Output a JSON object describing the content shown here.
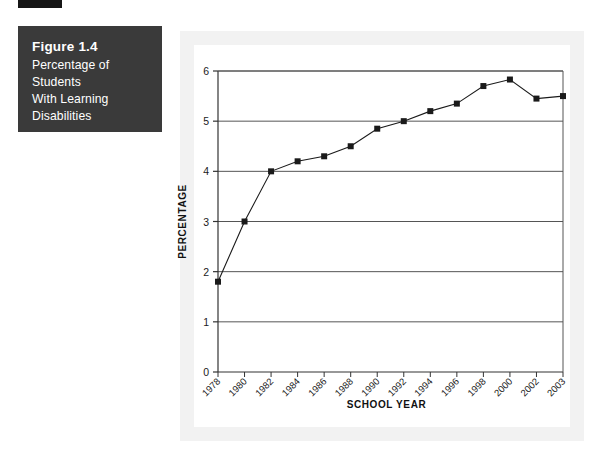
{
  "figure": {
    "number_label": "Figure 1.4",
    "title_lines": [
      "Percentage of Students",
      "With Learning",
      "Disabilities"
    ],
    "caption_bg": "#3a3a3a",
    "caption_fg": "#ffffff",
    "tab_color": "#161616"
  },
  "panel": {
    "outer_bg": "#f2f2f2",
    "inner_bg": "#ffffff",
    "page_bg": "#ffffff"
  },
  "chart_data": {
    "type": "line",
    "title": "",
    "xlabel": "SCHOOL YEAR",
    "ylabel": "PERCENTAGE",
    "categories": [
      "1978",
      "1980",
      "1982",
      "1984",
      "1986",
      "1988",
      "1990",
      "1992",
      "1994",
      "1996",
      "1998",
      "2000",
      "2002",
      "2003"
    ],
    "values": [
      1.8,
      3.0,
      4.0,
      4.2,
      4.3,
      4.5,
      4.85,
      5.0,
      5.2,
      5.35,
      5.7,
      5.83,
      5.45,
      5.5
    ],
    "ylim": [
      0,
      6
    ],
    "yticks": [
      0,
      1,
      2,
      3,
      4,
      5,
      6
    ],
    "ytick_labels": [
      "0",
      "1",
      "2",
      "3",
      "4",
      "5",
      "6"
    ],
    "grid": true,
    "grid_axis": "y",
    "legend": false,
    "legend_position": "none",
    "marker": "square",
    "line_color": "#1a1a1a",
    "marker_color": "#1a1a1a",
    "grid_color": "#555555",
    "xtick_rotation": 45
  }
}
